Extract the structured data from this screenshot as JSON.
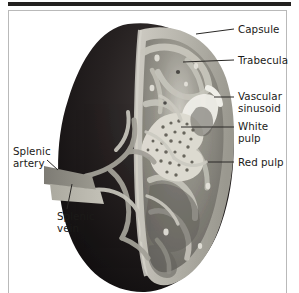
{
  "figure": {
    "kind": "anatomical-illustration",
    "view": "cut-away sagittal section",
    "background_color": "#ffffff",
    "frame_color": "#b9b9b9",
    "top_rule_color": "#23211f",
    "text_color": "#1b1a18",
    "leader_color": "#2a2826"
  },
  "palette": {
    "exterior_dark": "#231f1f",
    "exterior_dark_2": "#120f10",
    "capsule_band": "#b9b7ae",
    "capsule_band_light": "#cfcdc5",
    "parenchyma_mid": "#6e6c66",
    "parenchyma_light": "#9b998f",
    "trabecula": "#c8c6bd",
    "white_pulp": "#d9d7cd",
    "white_pulp_dots": "#6a675f",
    "red_pulp": "#7a7872",
    "sinusoid": "#efeee8",
    "artery_gray": "#8d8b84",
    "vein_gray": "#b5b3ab"
  },
  "labels": {
    "right": [
      {
        "id": "capsule",
        "text": "Capsule",
        "x": 238,
        "y": 24,
        "leader": {
          "x1": 196,
          "y1": 34,
          "x2": 234,
          "y2": 29
        }
      },
      {
        "id": "trabecula",
        "text": "Trabecula",
        "x": 238,
        "y": 55,
        "leader": {
          "x1": 183,
          "y1": 62,
          "x2": 234,
          "y2": 60
        }
      },
      {
        "id": "vascular-sinusoid",
        "text": "Vascular\nsinusoid",
        "x": 238,
        "y": 91,
        "leader": {
          "x1": 214,
          "y1": 97,
          "x2": 234,
          "y2": 97
        }
      },
      {
        "id": "white-pulp",
        "text": "White\npulp",
        "x": 238,
        "y": 121,
        "leader": {
          "x1": 181,
          "y1": 127,
          "x2": 234,
          "y2": 127
        }
      },
      {
        "id": "red-pulp",
        "text": "Red pulp",
        "x": 238,
        "y": 157,
        "leader": {
          "x1": 208,
          "y1": 162,
          "x2": 234,
          "y2": 162
        }
      }
    ],
    "left": [
      {
        "id": "splenic-artery",
        "text": "Splenic\nartery",
        "x": 13,
        "y": 146,
        "leader": {
          "x1": 47,
          "y1": 160,
          "x2": 58,
          "y2": 170
        }
      },
      {
        "id": "splenic-vein",
        "text": "Splenic\nvein",
        "x": 57,
        "y": 211,
        "leader": {
          "x1": 67,
          "y1": 209,
          "x2": 72,
          "y2": 184
        }
      }
    ]
  },
  "structures": [
    {
      "name": "capsule",
      "description": "outer fibrous covering, pale band around rim of sectioned half"
    },
    {
      "name": "trabecula",
      "description": "pale connective-tissue strands extending inward from capsule"
    },
    {
      "name": "vascular-sinusoid",
      "description": "light channel within parenchyma on right flank"
    },
    {
      "name": "white-pulp",
      "description": "pale speckled lymphoid nodule region in mid section"
    },
    {
      "name": "red-pulp",
      "description": "darker gray parenchyma filling remainder of section"
    },
    {
      "name": "splenic-artery",
      "description": "vessel entering hilum from left, mid-gray"
    },
    {
      "name": "splenic-vein",
      "description": "vessel exiting hilum from left, lighter gray, below artery"
    }
  ]
}
